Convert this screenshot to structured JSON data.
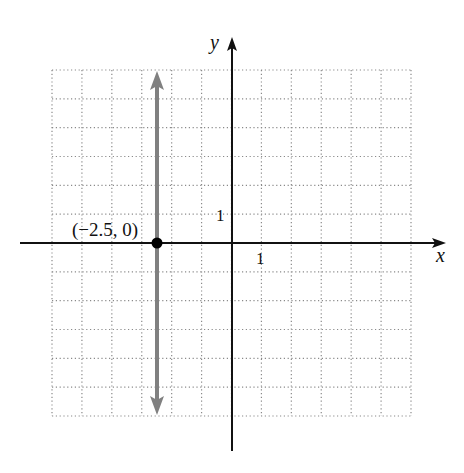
{
  "chart_data": {
    "type": "line",
    "title": "",
    "xlabel": "x",
    "ylabel": "y",
    "xlim": [
      -6,
      6
    ],
    "ylim": [
      -6,
      6
    ],
    "grid": true,
    "grid_style": "dotted",
    "tick_labels": {
      "x": [
        "1"
      ],
      "y": [
        "1"
      ]
    },
    "series": [
      {
        "name": "vertical line x = -2.5",
        "equation": "x = -2.5",
        "x": [
          -2.5,
          -2.5
        ],
        "y": [
          -6,
          6
        ],
        "color": "#808080",
        "arrows": "both"
      }
    ],
    "points": [
      {
        "x": -2.5,
        "y": 0,
        "label": "(−2.5, 0)",
        "color": "#000000"
      }
    ],
    "annotations": [
      "(−2.5, 0)"
    ]
  },
  "labels": {
    "x_axis": "x",
    "y_axis": "y",
    "x_tick": "1",
    "y_tick": "1",
    "point": "(−2.5, 0)"
  },
  "colors": {
    "axis": "#111111",
    "grid": "#8a8a8a",
    "line": "#808080",
    "point": "#000000"
  }
}
